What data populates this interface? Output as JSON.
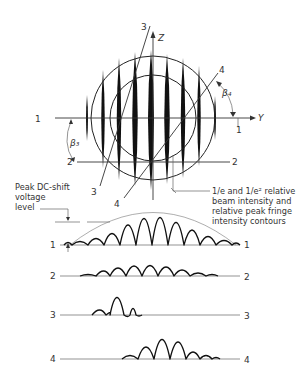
{
  "figure": {
    "axes": {
      "z_label": "Z",
      "y_label": "Y"
    },
    "angles": {
      "beta3": "β₃",
      "beta4": "β₄"
    },
    "scan_lines": [
      {
        "id": "1",
        "left": "1",
        "right": "1"
      },
      {
        "id": "2",
        "left": "2",
        "right": "2"
      },
      {
        "id": "3",
        "left": "3",
        "right": "3"
      },
      {
        "id": "4",
        "left": "4",
        "right": "4"
      }
    ],
    "annotations": {
      "peak_dc": [
        "Peak DC-shift",
        "voltage",
        "level"
      ],
      "contours": [
        "1/e and 1/e² relative",
        "beam intensity and",
        "relative peak fringe",
        "intensity contours"
      ]
    },
    "pattern_labels": {
      "line3_top": "3",
      "line4_top": "4",
      "line3_bottom": "3",
      "line4_bottom": "4"
    }
  }
}
